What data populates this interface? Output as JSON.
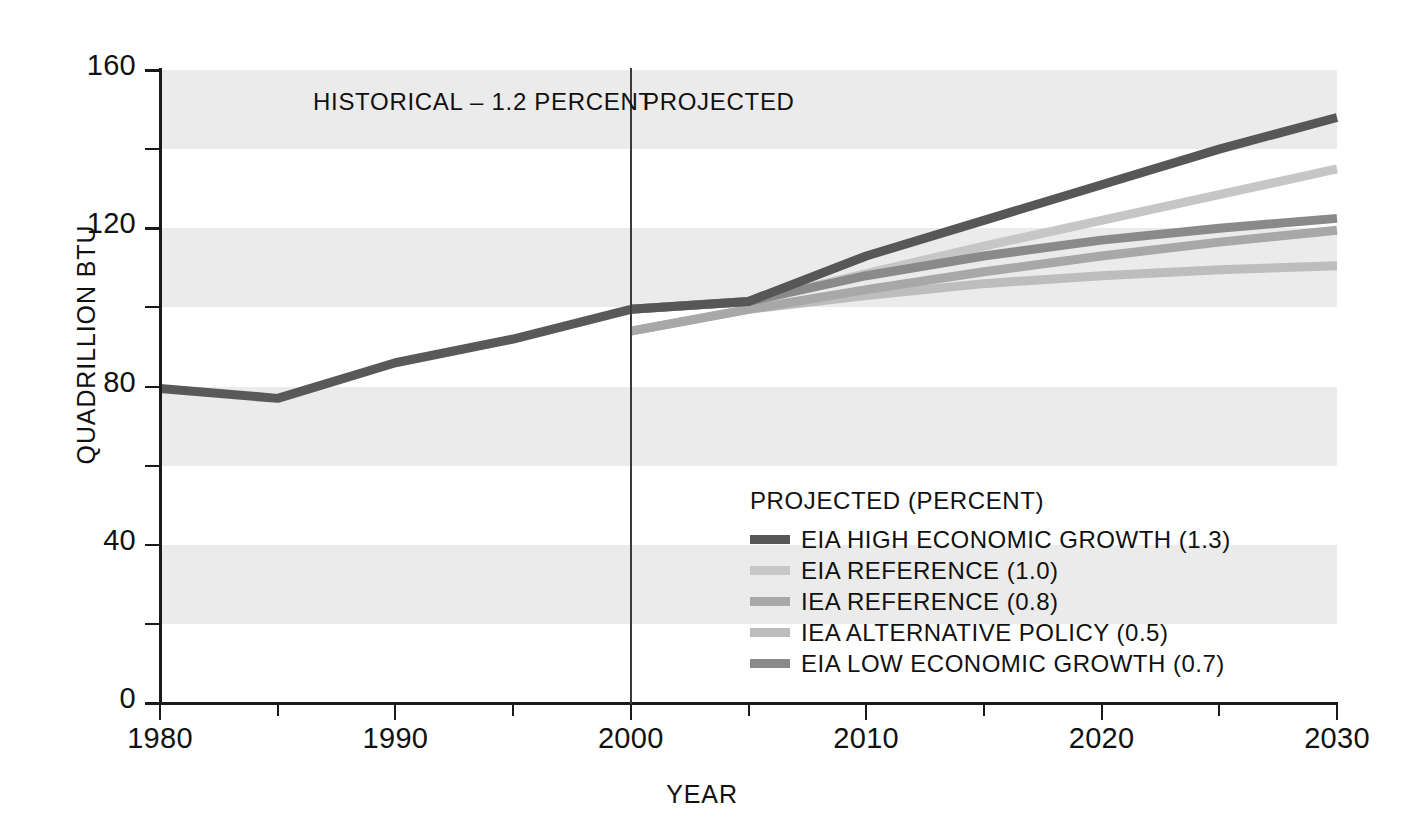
{
  "chart_data": {
    "type": "line",
    "title": "",
    "xlabel": "YEAR",
    "ylabel": "QUADRILLION BTU",
    "xlim": [
      1980,
      2030
    ],
    "ylim": [
      0,
      160
    ],
    "x_ticks": [
      1980,
      1990,
      2000,
      2010,
      2020,
      2030
    ],
    "x_minor_ticks": [
      1985,
      1995,
      2005,
      2015,
      2025
    ],
    "y_ticks": [
      0,
      40,
      80,
      120,
      160
    ],
    "y_minor_ticks": [
      20,
      60,
      100,
      140
    ],
    "grid": "horizontal alternating gray bands on upper half of each 40-unit interval",
    "legend_position": "inside lower-right of plot",
    "annotations": [
      {
        "text": "HISTORICAL – 1.2 PERCENT",
        "x": 1990,
        "y": 152
      },
      {
        "text": "PROJECTED",
        "x": 2004,
        "y": 152
      }
    ],
    "divider_x": 2000,
    "series": [
      {
        "name": "HISTORICAL",
        "color": "#595959",
        "x": [
          1980,
          1985,
          1990,
          1995,
          2000
        ],
        "values": [
          79.5,
          77.0,
          86.0,
          92.0,
          99.5
        ]
      },
      {
        "name": "EIA HIGH ECONOMIC GROWTH (1.3)",
        "color": "#575757",
        "x": [
          2000,
          2005,
          2010,
          2015,
          2020,
          2025,
          2030
        ],
        "values": [
          99.5,
          101.5,
          113.0,
          122.0,
          131.0,
          140.0,
          148.0
        ]
      },
      {
        "name": "EIA REFERENCE (1.0)",
        "color": "#c6c6c6",
        "x": [
          2000,
          2005,
          2010,
          2015,
          2020,
          2025,
          2030
        ],
        "values": [
          99.5,
          101.5,
          108.5,
          115.5,
          122.0,
          128.5,
          135.0
        ]
      },
      {
        "name": "IEA REFERENCE (0.8)",
        "color": "#a8a8a8",
        "x": [
          2000,
          2005,
          2010,
          2015,
          2020,
          2025,
          2030
        ],
        "values": [
          94.0,
          99.5,
          104.5,
          109.0,
          113.0,
          116.5,
          119.5
        ]
      },
      {
        "name": "IEA ALTERNATIVE POLICY (0.5)",
        "color": "#bdbdbd",
        "x": [
          2000,
          2005,
          2010,
          2015,
          2020,
          2025,
          2030
        ],
        "values": [
          94.0,
          99.5,
          103.0,
          106.0,
          108.0,
          109.5,
          110.5
        ]
      },
      {
        "name": "EIA LOW ECONOMIC GROWTH (0.7)",
        "color": "#8a8a8a",
        "x": [
          2000,
          2005,
          2010,
          2015,
          2020,
          2025,
          2030
        ],
        "values": [
          99.5,
          101.5,
          108.0,
          113.0,
          117.0,
          120.0,
          122.5
        ]
      }
    ]
  },
  "axis": {
    "y_title": "QUADRILLION BTU",
    "x_title": "YEAR",
    "y_tick_labels": [
      "160",
      "120",
      "80",
      "40",
      "0"
    ],
    "x_tick_labels": [
      "1980",
      "1990",
      "2000",
      "2010",
      "2020",
      "2030"
    ]
  },
  "phases": {
    "historical": "HISTORICAL – 1.2 PERCENT",
    "projected": "PROJECTED"
  },
  "legend": {
    "title": "PROJECTED (PERCENT)",
    "items": [
      {
        "label": "EIA HIGH ECONOMIC GROWTH (1.3)",
        "color": "#575757"
      },
      {
        "label": "EIA REFERENCE (1.0)",
        "color": "#c6c6c6"
      },
      {
        "label": "IEA REFERENCE (0.8)",
        "color": "#a8a8a8"
      },
      {
        "label": "IEA ALTERNATIVE POLICY (0.5)",
        "color": "#bdbdbd"
      },
      {
        "label": "EIA LOW ECONOMIC GROWTH (0.7)",
        "color": "#8a8a8a"
      }
    ]
  },
  "colors": {
    "band": "#ebebeb",
    "axis": "#1a1a1a",
    "divider": "#3a3a3a",
    "background": "#ffffff"
  }
}
